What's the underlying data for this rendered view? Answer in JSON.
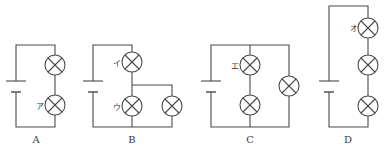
{
  "diagram": {
    "type": "circuit-diagrams",
    "stroke_color": "#4a4a4a",
    "circuits": [
      {
        "id": "A",
        "caption": "A",
        "description": "battery with two lamps in series",
        "lamp_labels": [
          "",
          "ア"
        ]
      },
      {
        "id": "B",
        "caption": "B",
        "description": "lamp イ in series with parallel pair (ウ and another lamp)",
        "lamp_labels": [
          "イ",
          "ウ",
          ""
        ]
      },
      {
        "id": "C",
        "caption": "C",
        "description": "two lamps in series (エ on top) in parallel with a single lamp",
        "lamp_labels": [
          "エ",
          "",
          ""
        ]
      },
      {
        "id": "D",
        "caption": "D",
        "description": "battery with three lamps in series",
        "lamp_labels": [
          "オ",
          "",
          ""
        ]
      }
    ]
  }
}
